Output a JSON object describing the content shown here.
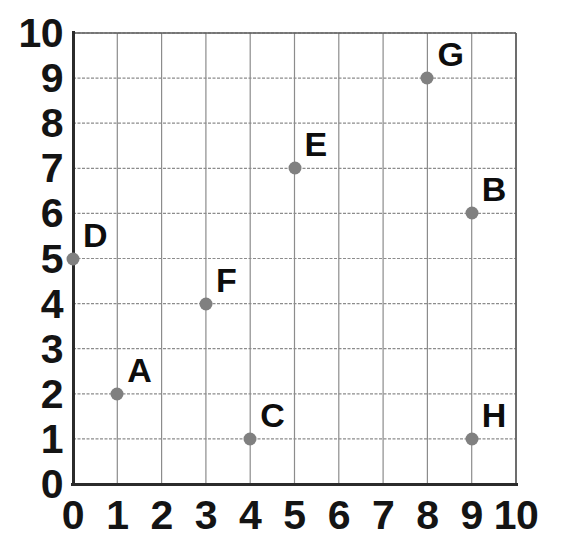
{
  "chart_data": {
    "type": "scatter",
    "title": "",
    "xlabel": "",
    "ylabel": "",
    "xlim": [
      0,
      10
    ],
    "ylim": [
      0,
      10
    ],
    "grid": true,
    "legend_position": "none",
    "x_tick_labels": [
      "0",
      "1",
      "2",
      "3",
      "4",
      "5",
      "6",
      "7",
      "8",
      "9",
      "10"
    ],
    "y_tick_labels": [
      "0",
      "1",
      "2",
      "3",
      "4",
      "5",
      "6",
      "7",
      "8",
      "9",
      "10"
    ],
    "x_ticks": [
      0,
      1,
      2,
      3,
      4,
      5,
      6,
      7,
      8,
      9,
      10
    ],
    "y_ticks": [
      0,
      1,
      2,
      3,
      4,
      5,
      6,
      7,
      8,
      9,
      10
    ],
    "point_color": "#808080",
    "label_color": "#0d0d0d",
    "grid_color": "#8c8c8c",
    "axis_color": "#2b2b2b",
    "points": [
      {
        "label": "A",
        "x": 1,
        "y": 2
      },
      {
        "label": "B",
        "x": 9,
        "y": 6
      },
      {
        "label": "C",
        "x": 4,
        "y": 1
      },
      {
        "label": "D",
        "x": 0,
        "y": 5
      },
      {
        "label": "E",
        "x": 5,
        "y": 7
      },
      {
        "label": "F",
        "x": 3,
        "y": 4
      },
      {
        "label": "G",
        "x": 8,
        "y": 9
      },
      {
        "label": "H",
        "x": 9,
        "y": 1
      }
    ]
  },
  "geometry": {
    "origin_x": 73,
    "origin_y": 484,
    "step_x": 44.3,
    "step_y": 45.1
  }
}
